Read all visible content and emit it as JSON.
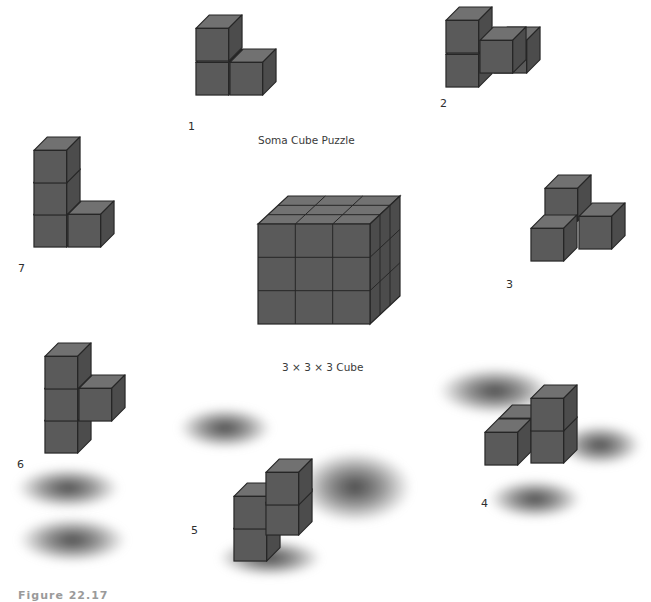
{
  "figure": {
    "title": "Soma Cube Puzzle",
    "center_caption": "3 × 3 × 3 Cube",
    "partial_bottom_caption": "Figure 22.17",
    "colors": {
      "top_face": "#717171",
      "front_face": "#5a5a5a",
      "side_face": "#4c4c4c",
      "edge": "#262626",
      "background": "#ffffff"
    },
    "pieces": [
      {
        "id": 1,
        "label": "1",
        "cubes": 3,
        "shape": "L-tri (V)"
      },
      {
        "id": 2,
        "label": "2",
        "cubes": 4,
        "shape": "left screw"
      },
      {
        "id": 3,
        "label": "3",
        "cubes": 4,
        "shape": "branch"
      },
      {
        "id": 4,
        "label": "4",
        "cubes": 4,
        "shape": "right screw"
      },
      {
        "id": 5,
        "label": "5",
        "cubes": 4,
        "shape": "S/Z"
      },
      {
        "id": 6,
        "label": "6",
        "cubes": 4,
        "shape": "T"
      },
      {
        "id": 7,
        "label": "7",
        "cubes": 4,
        "shape": "L"
      }
    ]
  }
}
